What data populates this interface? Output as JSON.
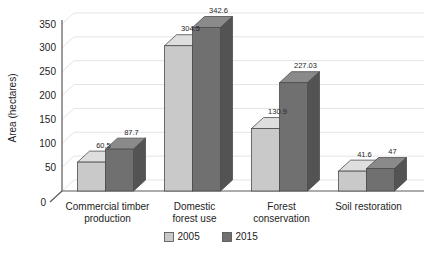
{
  "chart_data": {
    "type": "bar",
    "title": "",
    "subtitle": "",
    "xlabel": "",
    "ylabel": "Area (hectares)",
    "ylim": [
      0,
      350
    ],
    "yticks": [
      0,
      50,
      100,
      150,
      200,
      250,
      300,
      350
    ],
    "ytick_labels": [
      "0",
      "50",
      "100",
      "150",
      "200",
      "250",
      "300",
      "350"
    ],
    "grid": true,
    "grid_axis": "y",
    "legend_position": "bottom",
    "style": "3d-clustered-column",
    "categories": [
      "Commercial timber production",
      "Domestic forest use",
      "Forest conservation",
      "Soil restoration"
    ],
    "category_lines": [
      [
        "Commercial timber",
        "production"
      ],
      [
        "Domestic",
        "forest use"
      ],
      [
        "Forest",
        "conservation"
      ],
      [
        "Soil restoration"
      ]
    ],
    "series": [
      {
        "name": "2005",
        "color": "#c9c9c9",
        "side_color": "#a3a3a3",
        "top_color": "#dedede",
        "values": [
          60.5,
          304.5,
          130.9,
          41.6
        ],
        "value_labels": [
          "60.5",
          "304.5",
          "130.9",
          "41.6"
        ]
      },
      {
        "name": "2015",
        "color": "#707070",
        "side_color": "#535353",
        "top_color": "#8a8a8a",
        "values": [
          87.7,
          342.6,
          227.03,
          47
        ],
        "value_labels": [
          "87.7",
          "342.6",
          "227.03",
          "47"
        ]
      }
    ]
  },
  "legend": {
    "items": [
      {
        "label": "2005",
        "swatch_color": "#c9c9c9"
      },
      {
        "label": "2015",
        "swatch_color": "#707070"
      }
    ]
  },
  "axis": {
    "y_title": "Area (hectares)"
  },
  "colors": {
    "gridline": "#e4e4e4",
    "axis_line": "#5a5a5a",
    "bar_outline": "#4d4d4d",
    "background": "#ffffff",
    "text": "#1d1d1d"
  }
}
